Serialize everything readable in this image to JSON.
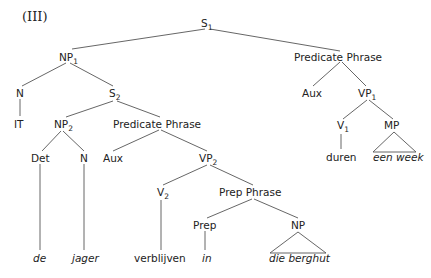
{
  "diagram": {
    "label": "(III)",
    "type": "syntax-tree",
    "nodes": {
      "s1": {
        "text": "S",
        "sub": "1"
      },
      "np1": {
        "text": "NP",
        "sub": "1"
      },
      "pp_top": {
        "text": "Predicate Phrase"
      },
      "n_top": {
        "text": "N"
      },
      "it": {
        "text": "IT"
      },
      "s2": {
        "text": "S",
        "sub": "2"
      },
      "aux_top": {
        "text": "Aux"
      },
      "vp1": {
        "text": "VP",
        "sub": "1"
      },
      "np2": {
        "text": "NP",
        "sub": "2"
      },
      "pp_mid": {
        "text": "Predicate Phrase"
      },
      "v1": {
        "text": "V",
        "sub": "1"
      },
      "mp": {
        "text": "MP"
      },
      "duren": {
        "text": "duren"
      },
      "een_week": {
        "text": "een week"
      },
      "det": {
        "text": "Det"
      },
      "n_mid": {
        "text": "N"
      },
      "aux_mid": {
        "text": "Aux"
      },
      "vp2": {
        "text": "VP",
        "sub": "2"
      },
      "v2": {
        "text": "V",
        "sub": "2"
      },
      "prep_phrase": {
        "text": "Prep Phrase"
      },
      "prep": {
        "text": "Prep"
      },
      "np": {
        "text": "NP"
      },
      "de": {
        "text": "de"
      },
      "jager": {
        "text": "jager"
      },
      "verblijven": {
        "text": "verblijven"
      },
      "in": {
        "text": "in"
      },
      "die_berghut": {
        "text": "die berghut"
      }
    }
  }
}
